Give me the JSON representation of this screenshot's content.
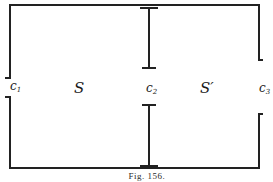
{
  "figure": {
    "caption": "Fig. 156.",
    "colors": {
      "ink": "#222222",
      "background": "#ffffff"
    },
    "labels": {
      "c1": {
        "main": "c",
        "sub": "1"
      },
      "s": "S",
      "c2": {
        "main": "c",
        "sub": "2"
      },
      "s_prime": "S′",
      "c3": {
        "main": "c",
        "sub": "3"
      }
    },
    "regions": [
      {
        "name": "S",
        "between": [
          "c1",
          "c2"
        ]
      },
      {
        "name": "S′",
        "between": [
          "c2",
          "c3"
        ]
      }
    ],
    "conductors": [
      {
        "id": "c1",
        "type": "gap-in-left-wall"
      },
      {
        "id": "c2",
        "type": "gap-between-central-T-bars"
      },
      {
        "id": "c3",
        "type": "gap-in-right-wall"
      }
    ]
  }
}
